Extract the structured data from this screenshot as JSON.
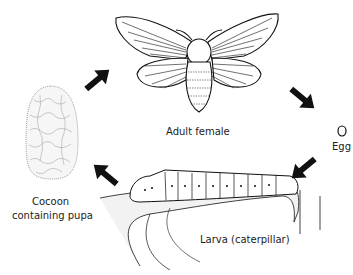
{
  "diagram": {
    "type": "life-cycle",
    "stages": [
      {
        "id": "adult",
        "label": "Adult female"
      },
      {
        "id": "egg",
        "label": "Egg"
      },
      {
        "id": "larva",
        "label": "Larva (caterpillar)"
      },
      {
        "id": "cocoon",
        "label_line1": "Cocoon",
        "label_line2": "containing pupa"
      }
    ],
    "arrows": [
      {
        "from": "cocoon",
        "to": "adult"
      },
      {
        "from": "adult",
        "to": "egg"
      },
      {
        "from": "egg",
        "to": "larva"
      },
      {
        "from": "larva",
        "to": "cocoon"
      }
    ],
    "colors": {
      "ink": "#111111",
      "background": "#ffffff"
    }
  }
}
